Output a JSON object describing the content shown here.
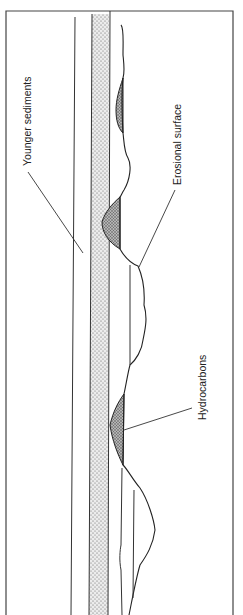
{
  "figure": {
    "type": "geological cross-section (rotated 90°)",
    "labels": {
      "younger_sediments": "Younger sediments",
      "erosional_surface": "Erosional surface",
      "hydrocarbons": "Hydrocarbons"
    },
    "colors": {
      "line": "#2a2a2a",
      "sand_fill": "#e6e6e6",
      "sand_dots": "#555555",
      "hydrocarbon_fill": "#9a9a9a",
      "background": "#ffffff"
    },
    "elements": [
      "outer-frame",
      "younger-sediments-boundary",
      "sandstone-seal-band",
      "erosional-surface",
      "hydrocarbon-trap-1",
      "hydrocarbon-trap-2",
      "hydrocarbon-trap-3"
    ]
  }
}
